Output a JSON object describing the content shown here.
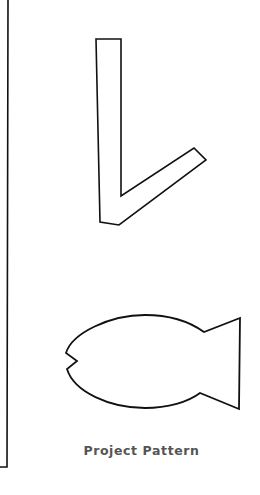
{
  "caption": "Project Pattern",
  "colors": {
    "background": "#ffffff",
    "outline": "#111111",
    "caption": "#555555"
  },
  "shapes": [
    {
      "name": "checkmark-shape",
      "type": "outline"
    },
    {
      "name": "fish-shape",
      "type": "outline"
    }
  ]
}
